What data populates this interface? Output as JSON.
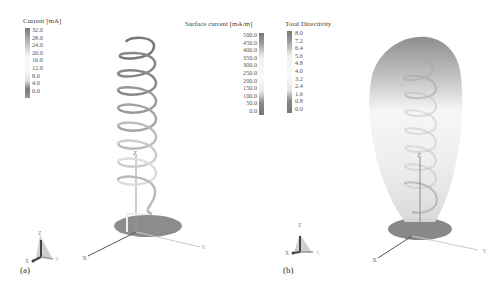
{
  "panels": [
    {
      "label": "(a)",
      "legends": [
        {
          "title": "Current [mA]",
          "ticks": [
            "32.0",
            "28.0",
            "24.0",
            "20.0",
            "16.0",
            "12.0",
            "8.0",
            "4.0",
            "0.0"
          ]
        },
        {
          "title": "Surface current [mA/m]",
          "ticks": [
            "500.0",
            "450.0",
            "400.0",
            "350.0",
            "300.0",
            "250.0",
            "200.0",
            "150.0",
            "100.0",
            "50.0",
            "0.0"
          ]
        }
      ],
      "axes": {
        "x": "X",
        "y": "Y",
        "z": "Z"
      },
      "orientation_triad": {
        "x": "X",
        "y": "Y",
        "z": "Z"
      }
    },
    {
      "label": "(b)",
      "legends": [
        {
          "title": "Total Directivity",
          "ticks": [
            "8.0",
            "7.2",
            "6.4",
            "5.6",
            "4.8",
            "4.0",
            "3.2",
            "2.4",
            "1.6",
            "0.8",
            "0.0"
          ]
        }
      ],
      "axes": {
        "x": "X",
        "y": "Y",
        "z": "Z"
      },
      "orientation_triad": {
        "x": "X",
        "y": "Y",
        "z": "Z"
      }
    }
  ],
  "colors": {
    "high": "#7a7a7a",
    "mid": "#f2f2f2",
    "low": "#6a6a6a",
    "ground_plane": "#8a8a8a"
  }
}
